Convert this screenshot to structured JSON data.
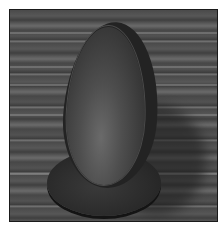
{
  "image": {
    "description": "Grayscale photograph of a hollow wooden egg-shaped bowl standing upright on a round wooden base, placed on a striped wooden plank surface",
    "subject": "wooden egg bowl on round base",
    "background": "wooden plank tabletop",
    "colors": {
      "page": "#ffffff",
      "border": "#1a1a1a",
      "wood_mid": "#555555",
      "object_dark": "#232323",
      "bowl_inner_light": "#6a6a6a"
    }
  }
}
